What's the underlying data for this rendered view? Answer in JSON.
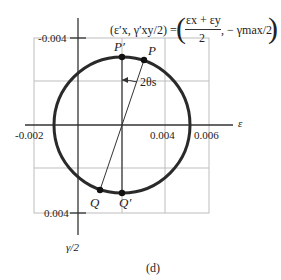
{
  "figure": {
    "caption": "(d)",
    "axes": {
      "x_label": "ε",
      "y_label": "γ/2",
      "x_ticks": [
        "-0.002",
        "0.004",
        "0.006"
      ],
      "y_ticks": [
        "-0.004",
        "0.004"
      ]
    },
    "annotation": {
      "lhs": "(ε′x, γ′xy/2) =",
      "frac_num": "εx + εy",
      "frac_den": "2",
      "rhs": ", − γmax/2"
    },
    "points": {
      "P": "P",
      "P_prime": "P′",
      "Q": "Q",
      "Q_prime": "Q′"
    },
    "angle_label": "2θs",
    "colors": {
      "circle": "#2a2a2a",
      "grid": "#b8b8b8",
      "axis": "#333333"
    }
  }
}
